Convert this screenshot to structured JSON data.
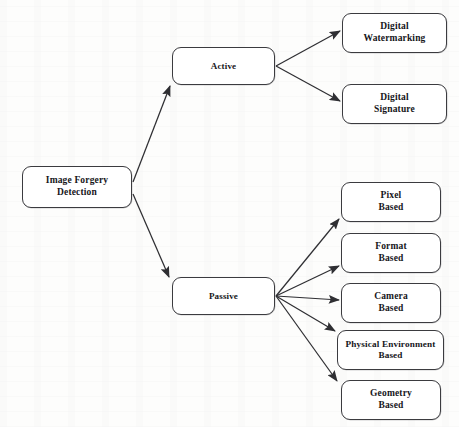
{
  "diagram": {
    "title": "Image Forgery Detection",
    "type": "tree-taxonomy",
    "stroke_color": "#3b3b3f",
    "text_color": "#16161a",
    "fill_color": "#ffffff",
    "background_color": "#fdfdfc",
    "nodes": {
      "root": {
        "label": "Image Forgery\nDetection",
        "x": 22,
        "y": 166,
        "w": 110,
        "h": 42
      },
      "active": {
        "label": "Active",
        "x": 172,
        "y": 47,
        "w": 103,
        "h": 38
      },
      "passive": {
        "label": "Passive",
        "x": 172,
        "y": 277,
        "w": 103,
        "h": 38
      },
      "digital_watermarking": {
        "label": "Digital\nWatermarking",
        "x": 342,
        "y": 13,
        "w": 105,
        "h": 40
      },
      "digital_signature": {
        "label": "Digital\nSignature",
        "x": 342,
        "y": 84,
        "w": 105,
        "h": 40
      },
      "pixel_based": {
        "label": "Pixel\nBased",
        "x": 341,
        "y": 182,
        "w": 100,
        "h": 40
      },
      "format_based": {
        "label": "Format\nBased",
        "x": 341,
        "y": 233,
        "w": 100,
        "h": 40
      },
      "camera_based": {
        "label": "Camera\nBased",
        "x": 341,
        "y": 283,
        "w": 100,
        "h": 40
      },
      "physical_environment_based": {
        "label": "Physical Environment\nBased",
        "x": 337,
        "y": 330,
        "w": 107,
        "h": 40
      },
      "geometry_based": {
        "label": "Geometry\nBased",
        "x": 341,
        "y": 380,
        "w": 100,
        "h": 40
      }
    },
    "edges": [
      {
        "from": "root",
        "to": "active",
        "x1": 133,
        "y1": 182,
        "x2": 170,
        "y2": 86
      },
      {
        "from": "root",
        "to": "passive",
        "x1": 133,
        "y1": 194,
        "x2": 169,
        "y2": 277
      },
      {
        "from": "active",
        "to": "digital_watermarking",
        "x1": 276,
        "y1": 66,
        "x2": 340,
        "y2": 31
      },
      {
        "from": "active",
        "to": "digital_signature",
        "x1": 276,
        "y1": 66,
        "x2": 340,
        "y2": 101
      },
      {
        "from": "passive",
        "to": "pixel_based",
        "x1": 276,
        "y1": 296,
        "x2": 339,
        "y2": 219
      },
      {
        "from": "passive",
        "to": "format_based",
        "x1": 276,
        "y1": 296,
        "x2": 339,
        "y2": 266
      },
      {
        "from": "passive",
        "to": "camera_based",
        "x1": 276,
        "y1": 296,
        "x2": 339,
        "y2": 300
      },
      {
        "from": "passive",
        "to": "physical_environment_based",
        "x1": 276,
        "y1": 296,
        "x2": 335,
        "y2": 331
      },
      {
        "from": "passive",
        "to": "geometry_based",
        "x1": 276,
        "y1": 296,
        "x2": 337,
        "y2": 381
      }
    ]
  }
}
